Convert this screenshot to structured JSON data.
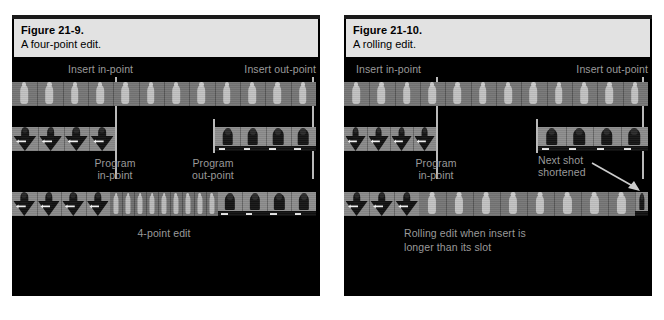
{
  "page": {
    "background": "#ffffff",
    "width": 664,
    "height": 320
  },
  "colors": {
    "panel_background": "#000000",
    "caption_background": "#e2e2e2",
    "caption_text": "#000000",
    "label_text": "#9a9a9a",
    "marker": "#b9b9b9",
    "film_base": "#767676"
  },
  "figures": [
    {
      "id": "figure-21-9",
      "caption": {
        "title": "Figure 21-9.",
        "subtitle": "A four-point edit."
      },
      "labels": {
        "insert_in": "Insert in-point",
        "insert_out": "Insert out-point",
        "program_in_line1": "Program",
        "program_in_line2": "in-point",
        "program_out_line1": "Program",
        "program_out_line2": "out-point",
        "result": "4-point edit"
      },
      "tracks": [
        {
          "name": "source-clip",
          "role": "insert source footage",
          "segments": [
            {
              "shot": "wide-figure",
              "frames": 4,
              "from_pct": 0,
              "to_pct": 31.5
            },
            {
              "shot": "wide-figure",
              "frames": 8,
              "from_pct": 31.5,
              "to_pct": 97.5
            }
          ]
        },
        {
          "name": "program-track",
          "role": "program timeline with gap",
          "segments": [
            {
              "shot": "arrow-figure",
              "frames": 4,
              "from_pct": 0,
              "to_pct": 31.5
            },
            {
              "shot": "gap",
              "frames": 0,
              "from_pct": 31.5,
              "to_pct": 66.5
            },
            {
              "shot": "two-shot",
              "frames": 4,
              "from_pct": 66.5,
              "to_pct": 100
            }
          ]
        },
        {
          "name": "result-track",
          "role": "edited result",
          "segments": [
            {
              "shot": "arrow-figure",
              "frames": 4,
              "from_pct": 0,
              "to_pct": 31.5
            },
            {
              "shot": "compressed-insert",
              "frames": 9,
              "from_pct": 31.5,
              "to_pct": 66.5
            },
            {
              "shot": "two-shot",
              "frames": 4,
              "from_pct": 66.5,
              "to_pct": 100
            }
          ]
        }
      ],
      "markers": [
        {
          "name": "insert-in-point",
          "x_pct": 31.5,
          "spans": "source-and-program"
        },
        {
          "name": "insert-out-point",
          "x_pct": 97.5,
          "spans": "source-and-program"
        },
        {
          "name": "program-in-point",
          "x_pct": 31.5,
          "spans": "program"
        },
        {
          "name": "program-out-point",
          "x_pct": 66.5,
          "spans": "program"
        }
      ]
    },
    {
      "id": "figure-21-10",
      "caption": {
        "title": "Figure 21-10.",
        "subtitle": "A rolling edit."
      },
      "labels": {
        "insert_in": "Insert in-point",
        "insert_out": "Insert out-point",
        "program_in_line1": "Program",
        "program_in_line2": "in-point",
        "next_shot_line1": "Next shot",
        "next_shot_line2": "shortened",
        "result_line1": "Rolling edit when insert is",
        "result_line2": "longer than its slot"
      },
      "tracks": [
        {
          "name": "source-clip",
          "role": "insert source footage",
          "segments": [
            {
              "shot": "wide-figure",
              "frames": 4,
              "from_pct": 0,
              "to_pct": 31.5
            },
            {
              "shot": "wide-figure",
              "frames": 8,
              "from_pct": 31.5,
              "to_pct": 97.5
            }
          ]
        },
        {
          "name": "program-track",
          "role": "program timeline with gap",
          "segments": [
            {
              "shot": "arrow-figure",
              "frames": 4,
              "from_pct": 0,
              "to_pct": 31.5
            },
            {
              "shot": "gap",
              "frames": 0,
              "from_pct": 31.5,
              "to_pct": 62
            },
            {
              "shot": "two-shot",
              "frames": 4,
              "from_pct": 62,
              "to_pct": 100
            }
          ]
        },
        {
          "name": "result-track",
          "role": "edited result, next shot truncated",
          "segments": [
            {
              "shot": "arrow-figure",
              "frames": 3,
              "from_pct": 0,
              "to_pct": 26
            },
            {
              "shot": "wide-figure",
              "frames": 8,
              "from_pct": 26,
              "to_pct": 96
            },
            {
              "shot": "two-shot",
              "frames": 1,
              "from_pct": 96,
              "to_pct": 100
            }
          ]
        }
      ],
      "markers": [
        {
          "name": "insert-in-point",
          "x_pct": 31.5,
          "spans": "source-and-program"
        },
        {
          "name": "insert-out-point",
          "x_pct": 97.5,
          "spans": "source-and-program"
        },
        {
          "name": "program-in-point",
          "x_pct": 31.5,
          "spans": "program"
        },
        {
          "name": "program-out-point",
          "x_pct": 62,
          "spans": "program"
        }
      ],
      "annotation": {
        "name": "next-shot-shortened-callout",
        "arrow": "diagonal-down-right"
      }
    }
  ]
}
